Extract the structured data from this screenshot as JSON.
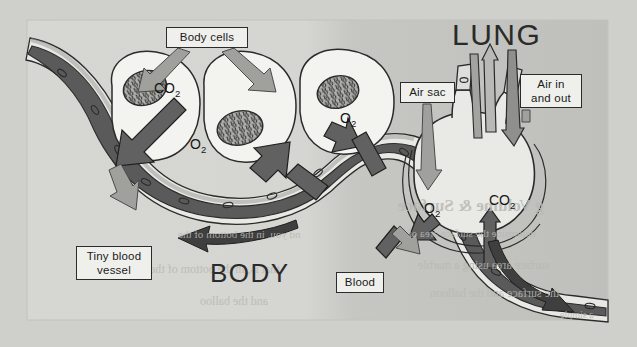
{
  "figure": {
    "panel": {
      "background_body": "#d4d4d0",
      "background_lung": "#c0c0bc",
      "page_background": "#cfcfcb"
    }
  },
  "regions": [
    {
      "name": "lung",
      "label": "LUNG",
      "x": 452,
      "y": 18,
      "font_size": 30
    },
    {
      "name": "body",
      "label": "BODY",
      "x": 210,
      "y": 258,
      "font_size": 26
    }
  ],
  "callouts": [
    {
      "name": "body-cells",
      "label": "Body cells",
      "x": 166,
      "y": 27,
      "w": 82,
      "h": 21
    },
    {
      "name": "air-sac",
      "label": "Air sac",
      "x": 400,
      "y": 82,
      "w": 55,
      "h": 21
    },
    {
      "name": "air-in-and-out",
      "label": "Air in\nand out",
      "x": 520,
      "y": 74,
      "w": 62,
      "h": 34
    },
    {
      "name": "tiny-blood-vessel",
      "label": "Tiny blood\nvessel",
      "x": 76,
      "y": 246,
      "w": 76,
      "h": 34
    },
    {
      "name": "blood",
      "label": "Blood",
      "x": 336,
      "y": 272,
      "w": 48,
      "h": 21
    }
  ],
  "gas_labels": [
    {
      "name": "co2-body-cell",
      "formula": "CO",
      "subscript": "2",
      "x": 154,
      "y": 80,
      "context": "carbon dioxide leaving body cell into blood"
    },
    {
      "name": "o2-body-cell-left",
      "formula": "O",
      "subscript": "2",
      "x": 190,
      "y": 136,
      "context": "oxygen entering body cell from blood"
    },
    {
      "name": "o2-body-cell-right",
      "formula": "O",
      "subscript": "2",
      "x": 340,
      "y": 110,
      "context": "oxygen entering body cell from blood"
    },
    {
      "name": "o2-air-sac",
      "formula": "O",
      "subscript": "2",
      "x": 424,
      "y": 200,
      "context": "oxygen moving from air sac into blood"
    },
    {
      "name": "co2-air-sac",
      "formula": "CO",
      "subscript": "2",
      "x": 489,
      "y": 192,
      "context": "carbon dioxide moving from blood into air sac"
    }
  ],
  "colors": {
    "deoxygenated_blood": "#5d5d5d",
    "oxygenated_blood": "#6e6e6e",
    "vessel_wall": "#e6e6e2",
    "cell_fill": "#f2f2ef",
    "nucleus_fill": "#a8a8a4",
    "arrow_gas_dark": "#6f6f6f",
    "arrow_pointer_light": "#9a9a98",
    "arrow_flow_dark": "#4a4a4a",
    "outline": "#2b2b2b",
    "label_box_fill": "#efefec"
  },
  "ghost_text": [
    {
      "name": "ghost-heading",
      "text": "g Volume & Surface",
      "x": 398,
      "y": 196,
      "size": 17,
      "weight": "bold"
    },
    {
      "name": "ghost-line-1",
      "text": "nd you, in the bottom of the",
      "x": 178,
      "y": 228,
      "size": 11,
      "weight": "normal"
    },
    {
      "name": "ghost-line-2",
      "text": "determine the surface area of",
      "x": 408,
      "y": 227,
      "size": 11,
      "weight": "normal"
    },
    {
      "name": "ghost-line-3",
      "text": "that is, in the bottom of the",
      "x": 150,
      "y": 262,
      "size": 12,
      "weight": "normal"
    },
    {
      "name": "ghost-line-4",
      "text": "surface area using a marble",
      "x": 418,
      "y": 258,
      "size": 12,
      "weight": "normal"
    },
    {
      "name": "ghost-line-5",
      "text": "the surface and the balloon",
      "x": 430,
      "y": 286,
      "size": 12,
      "weight": "normal"
    },
    {
      "name": "ghost-line-6",
      "text": "and the balloo",
      "x": 200,
      "y": 294,
      "size": 12,
      "weight": "normal"
    },
    {
      "name": "ghost-line-7",
      "text": "a simple",
      "x": 560,
      "y": 309,
      "size": 10,
      "weight": "normal"
    }
  ],
  "structures": [
    {
      "name": "body-cell-1",
      "type": "cell",
      "description": "Left body cell with nucleus"
    },
    {
      "name": "body-cell-2",
      "type": "cell",
      "description": "Middle body cell with nucleus"
    },
    {
      "name": "body-cell-3",
      "type": "cell",
      "description": "Right body cell with nucleus"
    },
    {
      "name": "capillary",
      "type": "vessel",
      "description": "Tiny blood vessel winding from body cells to the lung"
    },
    {
      "name": "air-sac",
      "type": "alveolus",
      "description": "Rounded air sac in the lung"
    },
    {
      "name": "airway-tubes",
      "type": "bronchiole",
      "description": "Tube carrying air in and out of the air sac"
    }
  ]
}
